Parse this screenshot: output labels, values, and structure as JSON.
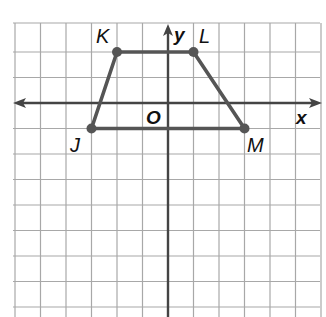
{
  "diagram": {
    "type": "coordinate-plane",
    "axes": {
      "x_label": "x",
      "y_label": "y",
      "origin_label": "O"
    },
    "grid": {
      "x_min": -6,
      "x_max": 6,
      "y_min": -8,
      "y_max": 3,
      "step": 1
    },
    "shape": "trapezoid",
    "points": [
      {
        "name": "K",
        "x": -2,
        "y": 2
      },
      {
        "name": "L",
        "x": 1,
        "y": 2
      },
      {
        "name": "M",
        "x": 3,
        "y": -1
      },
      {
        "name": "J",
        "x": -3,
        "y": -1
      }
    ],
    "colors": {
      "grid": "#a8a8a8",
      "axis": "#444444",
      "shape": "#555555",
      "point": "#555555"
    }
  }
}
